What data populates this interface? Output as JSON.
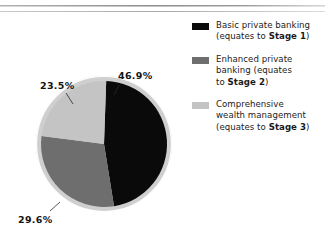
{
  "chart_data": {
    "type": "pie",
    "title": "",
    "categories": [
      "Basic private banking (equates to Stage 1)",
      "Enhanced private banking (equates to Stage 2)",
      "Comprehensive wealth management (equates to Stage 3)"
    ],
    "values": [
      46.9,
      29.6,
      23.5
    ],
    "value_labels": [
      "46.9%",
      "29.6%",
      "23.5%"
    ],
    "units": "percent",
    "colors": [
      "#0a0a0a",
      "#6e6e6e",
      "#c4c4c4"
    ],
    "start_angle_deg": 2,
    "direction": "clockwise",
    "legend_position": "right",
    "grid": false,
    "ring_color": "#cfcfcf"
  },
  "labels": {
    "basic": "46.9%",
    "enhanced": "29.6%",
    "comprehensive": "23.5%"
  },
  "legend": {
    "items": [
      {
        "swatch_color": "#0a0a0a",
        "line1": "Basic private banking",
        "line2_prefix": "(equates to ",
        "line2_bold": "Stage 1",
        "line2_suffix": ")"
      },
      {
        "swatch_color": "#6e6e6e",
        "line1": "Enhanced private",
        "line2": "banking (equates",
        "line3_prefix": "to ",
        "line3_bold": "Stage 2",
        "line3_suffix": ")"
      },
      {
        "swatch_color": "#c4c4c4",
        "line1": "Comprehensive",
        "line2": "wealth management",
        "line3_prefix": "(equates to ",
        "line3_bold": "Stage 3",
        "line3_suffix": ")"
      }
    ]
  }
}
